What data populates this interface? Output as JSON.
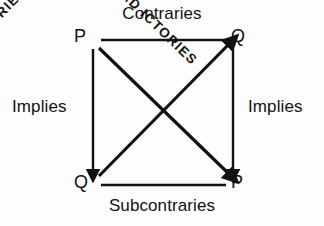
{
  "diagram": {
    "background_color": "#fdfdfd",
    "ink_color": "#111111",
    "corners": {
      "top_left": "P",
      "top_right": "Q",
      "bottom_left": "Q",
      "bottom_right": "P"
    },
    "edges": {
      "top_label": "Contraries",
      "bottom_label": "Subcontraries",
      "left_label": "Implies",
      "right_label": "Implies"
    },
    "diagonals": {
      "nw_se_label": "CONTRADICTORIES",
      "sw_ne_label": "CONTRADICTORIES",
      "nw_se_first_part": "CONTRAD",
      "nw_se_second_part": "ICTORIES",
      "sw_ne_first_part": "CONTRADI",
      "sw_ne_second_part": "CTORIES"
    },
    "icons": {
      "left_arrow": "arrow-down-icon",
      "right_arrow": "arrow-down-icon",
      "diagonal_ne_arrow": "arrow-up-right-icon",
      "diagonal_se_arrow": "arrow-down-right-icon"
    }
  }
}
